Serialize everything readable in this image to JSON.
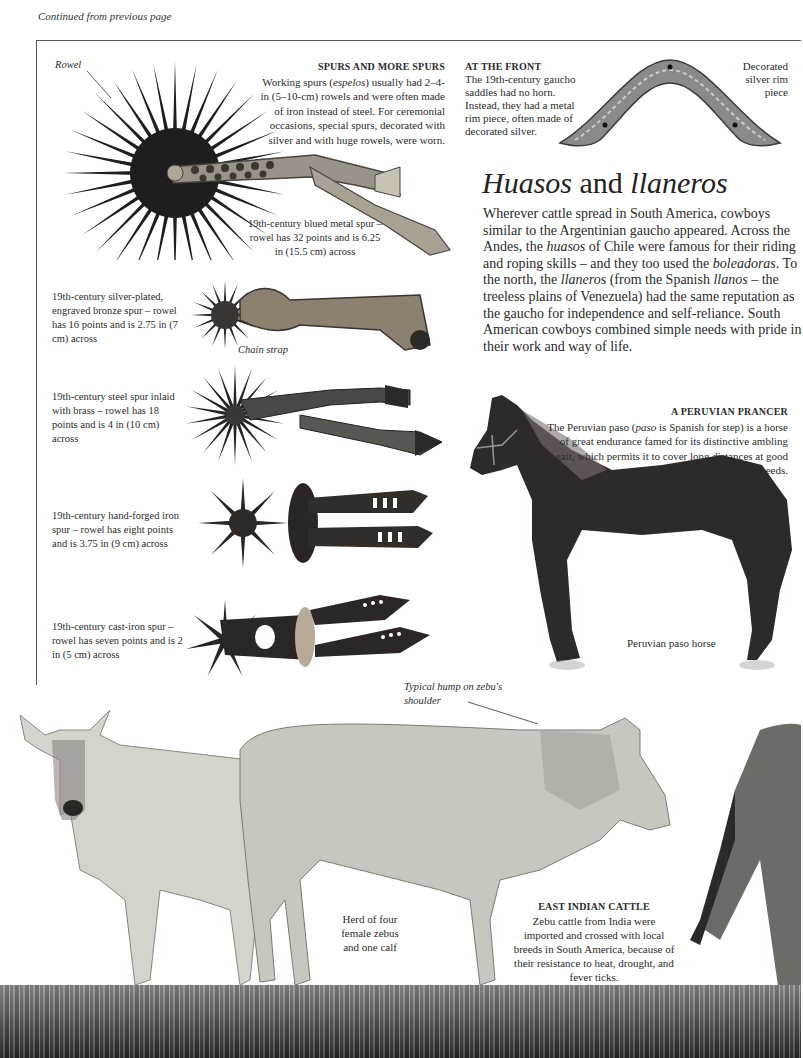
{
  "page": {
    "continued": "Continued from previous page",
    "title": {
      "part1": "Huasos",
      "part2": " and ",
      "part3": "llaneros"
    },
    "body": {
      "s1": "Wherever cattle spread in South America, cowboys similar to the Argentinian gaucho appeared. Across the Andes, the ",
      "i1": "huasos",
      "s2": " of Chile were famous for their riding and roping skills – and they too used the ",
      "i2": "boleadoras",
      "s3": ". To the north, the ",
      "i3": "llaneros",
      "s4": " (from the Spanish ",
      "i4": "llanos",
      "s5": " – the treeless plains of Venezuela) had the same reputation as the gaucho for independence and self-reliance. South American cowboys combined simple needs with pride in their work and way of life."
    }
  },
  "spurs_box": {
    "heading": "SPURS AND MORE SPURS",
    "text_a": "Working spurs (",
    "text_i": "espelos",
    "text_b": ") usually had 2–4-in (5–10-cm) rowels and were often made of iron instead of steel. For ceremonial occasions, special spurs, decorated with silver and with huge rowels, were worn."
  },
  "labels": {
    "rowel": "Rowel",
    "chain_strap": "Chain strap",
    "zebu_hump": "Typical hump on zebu's shoulder",
    "horse": "Peruvian paso horse",
    "herd": "Herd of four female zebus and one calf",
    "rim_piece": "Decorated silver rim piece"
  },
  "spurs": [
    {
      "caption": "19th-century blued metal spur – rowel has 32 points and is 6.25 in (15.5 cm) across",
      "points": 32
    },
    {
      "caption": "19th-century silver-plated, engraved bronze spur – rowel has 16 points and is 2.75 in (7 cm) across",
      "points": 16
    },
    {
      "caption": "19th-century steel spur inlaid with brass – rowel has 18 points and is 4 in (10 cm) across",
      "points": 18
    },
    {
      "caption": "19th-century hand-forged iron spur – rowel has eight points and is 3.75 in (9 cm) across",
      "points": 8
    },
    {
      "caption": "19th-century cast-iron spur – rowel has seven points and is 2 in (5 cm) across",
      "points": 7
    }
  ],
  "at_front": {
    "heading": "AT THE FRONT",
    "text": "The 19th-century gaucho saddles had no horn. Instead, they had a metal rim piece, often made of decorated silver."
  },
  "prancer": {
    "heading": "A PERUVIAN PRANCER",
    "text_a": "The Peruvian paso (",
    "text_i": "paso",
    "text_b": " is Spanish for step) is a horse of great endurance famed for its distinctive ambling gait, which permits it to cover long distances at good speeds."
  },
  "cattle": {
    "heading": "EAST INDIAN CATTLE",
    "text": "Zebu cattle from India were imported and crossed with local breeds in South America, because of their resistance to heat, drought, and fever ticks."
  },
  "colors": {
    "frame": "#555555",
    "spur_dark": "#1e1e1e",
    "horse": "#2e2a28",
    "zebu": "#c9c6c0",
    "ground": "#3e3e3e"
  }
}
